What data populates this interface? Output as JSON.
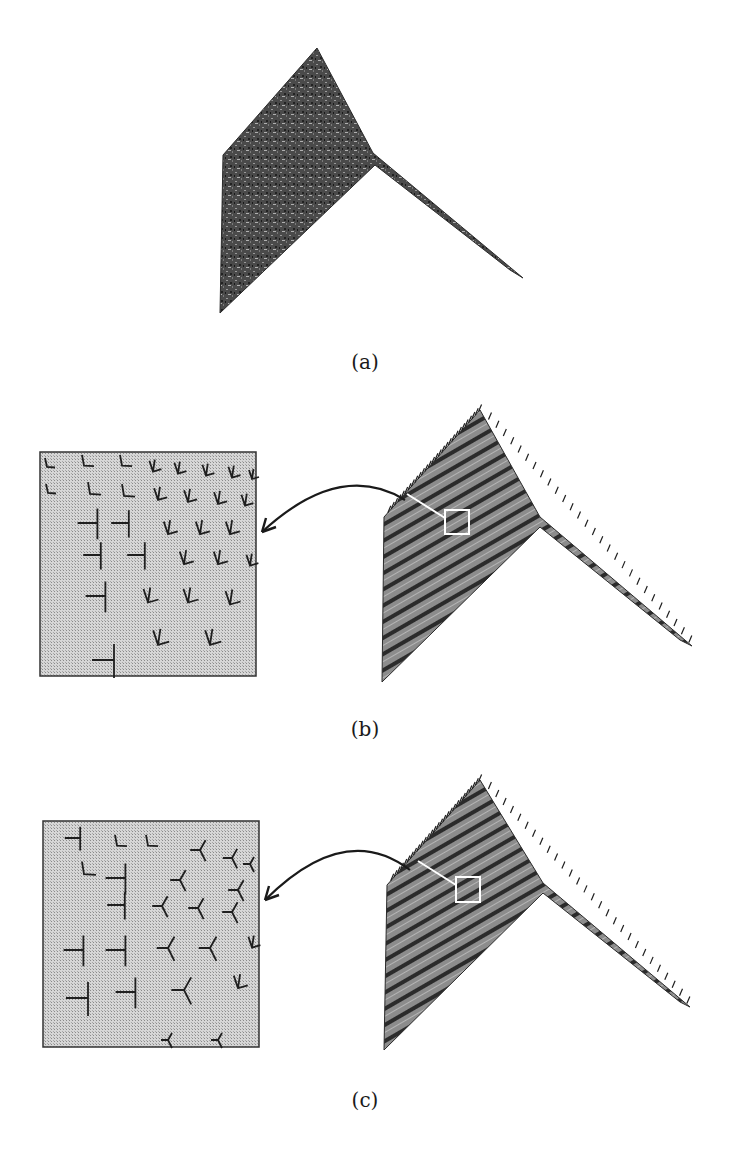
{
  "figure": {
    "panels": [
      {
        "id": "a",
        "label": "(a)",
        "label_pos": [
          365,
          350
        ],
        "surface": {
          "outline": [
            [
              317,
              48
            ],
            [
              373,
              153
            ],
            [
              523,
              278
            ],
            [
              510,
              270
            ],
            [
              375,
              165
            ],
            [
              220,
              313
            ],
            [
              223,
              155
            ]
          ],
          "fill": "#4a4a4a",
          "texture": "noisy"
        }
      },
      {
        "id": "b",
        "label": "(b)",
        "label_pos": [
          365,
          717
        ],
        "inset": {
          "box": [
            40,
            452,
            216,
            224
          ],
          "fill": "#cfcfcf",
          "markers": [
            {
              "type": "L",
              "x": 45,
              "y": 464,
              "s": 10
            },
            {
              "type": "L",
              "x": 82,
              "y": 462,
              "s": 12
            },
            {
              "type": "L",
              "x": 120,
              "y": 462,
              "s": 12
            },
            {
              "type": "V",
              "x": 153,
              "y": 468,
              "s": 12
            },
            {
              "type": "V",
              "x": 178,
              "y": 470,
              "s": 12
            },
            {
              "type": "V",
              "x": 206,
              "y": 472,
              "s": 12
            },
            {
              "type": "V",
              "x": 232,
              "y": 474,
              "s": 12
            },
            {
              "type": "V",
              "x": 252,
              "y": 476,
              "s": 10
            },
            {
              "type": "L",
              "x": 46,
              "y": 490,
              "s": 10
            },
            {
              "type": "L",
              "x": 88,
              "y": 490,
              "s": 13
            },
            {
              "type": "L",
              "x": 122,
              "y": 492,
              "s": 13
            },
            {
              "type": "V",
              "x": 158,
              "y": 496,
              "s": 13
            },
            {
              "type": "V",
              "x": 188,
              "y": 498,
              "s": 13
            },
            {
              "type": "V",
              "x": 218,
              "y": 500,
              "s": 13
            },
            {
              "type": "V",
              "x": 245,
              "y": 502,
              "s": 12
            },
            {
              "type": "T",
              "x": 92,
              "y": 523,
              "s": 18
            },
            {
              "type": "T",
              "x": 124,
              "y": 523,
              "s": 16
            },
            {
              "type": "V",
              "x": 168,
              "y": 530,
              "s": 14
            },
            {
              "type": "V",
              "x": 200,
              "y": 530,
              "s": 14
            },
            {
              "type": "V",
              "x": 230,
              "y": 530,
              "s": 14
            },
            {
              "type": "T",
              "x": 96,
              "y": 555,
              "s": 16
            },
            {
              "type": "T",
              "x": 140,
              "y": 555,
              "s": 16
            },
            {
              "type": "V",
              "x": 184,
              "y": 560,
              "s": 14
            },
            {
              "type": "V",
              "x": 218,
              "y": 560,
              "s": 14
            },
            {
              "type": "V",
              "x": 250,
              "y": 562,
              "s": 12
            },
            {
              "type": "T",
              "x": 100,
              "y": 596,
              "s": 18
            },
            {
              "type": "V",
              "x": 148,
              "y": 598,
              "s": 15
            },
            {
              "type": "V",
              "x": 188,
              "y": 598,
              "s": 15
            },
            {
              "type": "V",
              "x": 230,
              "y": 600,
              "s": 15
            },
            {
              "type": "V",
              "x": 158,
              "y": 640,
              "s": 16
            },
            {
              "type": "V",
              "x": 210,
              "y": 640,
              "s": 16
            },
            {
              "type": "T",
              "x": 108,
              "y": 660,
              "s": 20
            }
          ]
        },
        "surface": {
          "outline": [
            [
              480,
              410
            ],
            [
              540,
              517
            ],
            [
              692,
              646
            ],
            [
              680,
              640
            ],
            [
              540,
              527
            ],
            [
              382,
              682
            ],
            [
              384,
              517
            ]
          ],
          "fill": "#5a5a5a",
          "texture": "striped"
        },
        "highlight_box": [
          445,
          510,
          24,
          24
        ],
        "arrow": {
          "path": "M 405 500 Q 340 460 262 532",
          "head": [
            262,
            532
          ]
        }
      },
      {
        "id": "c",
        "label": "(c)",
        "label_pos": [
          365,
          1088
        ],
        "inset": {
          "box": [
            43,
            821,
            216,
            226
          ],
          "fill": "#cfcfcf",
          "markers": [
            {
              "type": "T",
              "x": 76,
              "y": 838,
              "s": 14
            },
            {
              "type": "L",
              "x": 115,
              "y": 842,
              "s": 12
            },
            {
              "type": "L",
              "x": 146,
              "y": 842,
              "s": 12
            },
            {
              "type": "Y",
              "x": 200,
              "y": 850,
              "s": 14
            },
            {
              "type": "Y",
              "x": 232,
              "y": 858,
              "s": 13
            },
            {
              "type": "Y",
              "x": 250,
              "y": 864,
              "s": 10
            },
            {
              "type": "L",
              "x": 82,
              "y": 870,
              "s": 14
            },
            {
              "type": "T",
              "x": 120,
              "y": 878,
              "s": 18
            },
            {
              "type": "Y",
              "x": 180,
              "y": 880,
              "s": 14
            },
            {
              "type": "Y",
              "x": 238,
              "y": 890,
              "s": 14
            },
            {
              "type": "T",
              "x": 120,
              "y": 905,
              "s": 16
            },
            {
              "type": "Y",
              "x": 162,
              "y": 906,
              "s": 14
            },
            {
              "type": "Y",
              "x": 198,
              "y": 908,
              "s": 14
            },
            {
              "type": "Y",
              "x": 232,
              "y": 912,
              "s": 14
            },
            {
              "type": "T",
              "x": 78,
              "y": 950,
              "s": 18
            },
            {
              "type": "T",
              "x": 120,
              "y": 950,
              "s": 18
            },
            {
              "type": "Y",
              "x": 168,
              "y": 948,
              "s": 16
            },
            {
              "type": "Y",
              "x": 210,
              "y": 948,
              "s": 16
            },
            {
              "type": "V",
              "x": 252,
              "y": 944,
              "s": 12
            },
            {
              "type": "T",
              "x": 82,
              "y": 998,
              "s": 20
            },
            {
              "type": "T",
              "x": 130,
              "y": 992,
              "s": 18
            },
            {
              "type": "Y",
              "x": 184,
              "y": 990,
              "s": 18
            },
            {
              "type": "V",
              "x": 238,
              "y": 984,
              "s": 14
            },
            {
              "type": "Y",
              "x": 168,
              "y": 1040,
              "s": 10
            },
            {
              "type": "Y",
              "x": 218,
              "y": 1040,
              "s": 10
            }
          ]
        },
        "surface": {
          "outline": [
            [
              480,
              780
            ],
            [
              543,
              883
            ],
            [
              690,
              1007
            ],
            [
              680,
              1002
            ],
            [
              543,
              893
            ],
            [
              384,
              1050
            ],
            [
              387,
              885
            ]
          ],
          "fill": "#5e5e5e",
          "texture": "striped"
        },
        "highlight_box": [
          456,
          877,
          24,
          25
        ],
        "arrow": {
          "path": "M 410 870 Q 345 820 265 900",
          "head": [
            265,
            900
          ]
        }
      }
    ]
  }
}
